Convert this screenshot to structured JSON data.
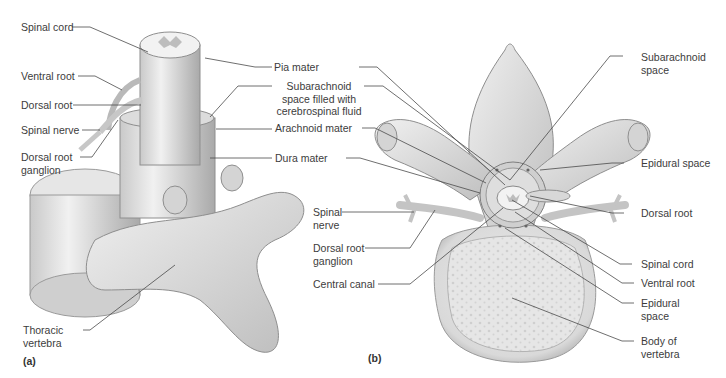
{
  "figure": {
    "panels": [
      {
        "id": "a",
        "tag": "(a)",
        "labels": {
          "spinal_cord": "Spinal cord",
          "ventral_root": "Ventral root",
          "dorsal_root": "Dorsal root",
          "spinal_nerve": "Spinal nerve",
          "dorsal_root_ganglion_l1": "Dorsal root",
          "dorsal_root_ganglion_l2": "ganglion",
          "thoracic_vertebra_l1": "Thoracic",
          "thoracic_vertebra_l2": "vertebra"
        }
      },
      {
        "id": "shared",
        "labels": {
          "pia_mater": "Pia mater",
          "subarachnoid_csf_l1": "Subarachnoid",
          "subarachnoid_csf_l2": "space filled with",
          "subarachnoid_csf_l3": "cerebrospinal fluid",
          "arachnoid_mater": "Arachnoid mater",
          "dura_mater": "Dura mater"
        }
      },
      {
        "id": "b",
        "tag": "(b)",
        "labels": {
          "spinal_nerve_l1": "Spinal",
          "spinal_nerve_l2": "nerve",
          "dorsal_root_ganglion_l1": "Dorsal root",
          "dorsal_root_ganglion_l2": "ganglion",
          "central_canal": "Central canal",
          "subarachnoid_space_l1": "Subarachnoid",
          "subarachnoid_space_l2": "space",
          "epidural_space_top": "Epidural space",
          "dorsal_root": "Dorsal root",
          "spinal_cord": "Spinal cord",
          "ventral_root": "Ventral root",
          "epidural_space_l1": "Epidural",
          "epidural_space_l2": "space",
          "body_of_vertebra_l1": "Body of",
          "body_of_vertebra_l2": "vertebra"
        }
      }
    ],
    "colors": {
      "bone": "#e4e4e4",
      "bone_shadow": "#b9b9b9",
      "outline": "#8e8e8e",
      "leader_line": "#4a4a4a",
      "text": "#3c3c3c"
    }
  }
}
